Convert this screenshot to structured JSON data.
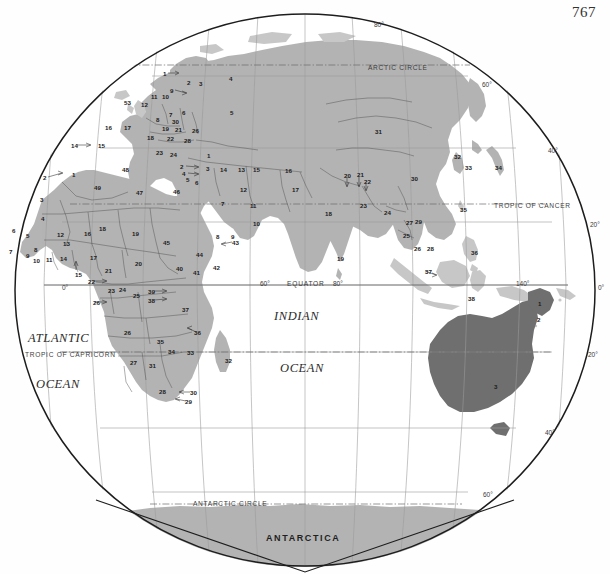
{
  "page": {
    "number": "767",
    "background_color": "#ffffff",
    "land_color": "#b3b3b3",
    "land_dark_color": "#6e6e6e",
    "island_color": "#c9c9c9",
    "border_color": "#555555",
    "graticule_color": "#8d8d8d",
    "outline_color": "#1a1a1a"
  },
  "oceans": [
    {
      "id": "atlantic",
      "line1": "ATLANTIC",
      "line2": "OCEAN",
      "x1": 28,
      "y1": 332,
      "x2": 36,
      "y2": 378
    },
    {
      "id": "indian",
      "line1": "INDIAN",
      "line2": "OCEAN",
      "x1": 274,
      "y1": 310,
      "x2": 280,
      "y2": 362
    }
  ],
  "reference_lines": [
    {
      "name": "arctic-circle",
      "label": "ARCTIC CIRCLE",
      "x": 368,
      "y": 65
    },
    {
      "name": "tropic-of-cancer",
      "label": "TROPIC OF CANCER",
      "x": 494,
      "y": 203
    },
    {
      "name": "equator",
      "label": "EQUATOR",
      "x": 287,
      "y": 281
    },
    {
      "name": "tropic-of-capricorn",
      "label": "TROPIC OF CAPRICORN",
      "x": 25,
      "y": 352
    },
    {
      "name": "antarctic-circle",
      "label": "ANTARCTIC CIRCLE",
      "x": 193,
      "y": 501
    },
    {
      "name": "antarctica",
      "label": "ANTARCTICA",
      "x": 266,
      "y": 534
    }
  ],
  "graticule_labels": [
    {
      "label": "80°",
      "x": 374,
      "y": 22
    },
    {
      "label": "60°",
      "x": 482,
      "y": 82
    },
    {
      "label": "40°",
      "x": 548,
      "y": 148
    },
    {
      "label": "20°",
      "x": 590,
      "y": 222
    },
    {
      "label": "0°",
      "x": 598,
      "y": 285
    },
    {
      "label": "20°",
      "x": 588,
      "y": 352
    },
    {
      "label": "40°",
      "x": 545,
      "y": 430
    },
    {
      "label": "60°",
      "x": 483,
      "y": 492
    },
    {
      "label": "0°",
      "x": 62,
      "y": 285
    },
    {
      "label": "60°",
      "x": 260,
      "y": 281
    },
    {
      "label": "80°",
      "x": 333,
      "y": 281
    },
    {
      "label": "140°",
      "x": 516,
      "y": 281
    }
  ],
  "country_numbers": [
    {
      "n": "1",
      "x": 163,
      "y": 71,
      "leader": "right"
    },
    {
      "n": "2",
      "x": 187,
      "y": 80
    },
    {
      "n": "3",
      "x": 199,
      "y": 81
    },
    {
      "n": "4",
      "x": 229,
      "y": 76
    },
    {
      "n": "9",
      "x": 170,
      "y": 88,
      "leader": "right"
    },
    {
      "n": "10",
      "x": 162,
      "y": 94
    },
    {
      "n": "11",
      "x": 151,
      "y": 94
    },
    {
      "n": "12",
      "x": 141,
      "y": 102
    },
    {
      "n": "53",
      "x": 124,
      "y": 100
    },
    {
      "n": "5",
      "x": 230,
      "y": 110
    },
    {
      "n": "6",
      "x": 182,
      "y": 110
    },
    {
      "n": "7",
      "x": 169,
      "y": 112
    },
    {
      "n": "8",
      "x": 156,
      "y": 117
    },
    {
      "n": "30",
      "x": 172,
      "y": 119
    },
    {
      "n": "16",
      "x": 105,
      "y": 125
    },
    {
      "n": "17",
      "x": 124,
      "y": 125
    },
    {
      "n": "19",
      "x": 162,
      "y": 126
    },
    {
      "n": "21",
      "x": 175,
      "y": 127
    },
    {
      "n": "26",
      "x": 192,
      "y": 128
    },
    {
      "n": "18",
      "x": 147,
      "y": 135
    },
    {
      "n": "22",
      "x": 167,
      "y": 136
    },
    {
      "n": "28",
      "x": 184,
      "y": 138
    },
    {
      "n": "23",
      "x": 156,
      "y": 150
    },
    {
      "n": "24",
      "x": 170,
      "y": 152
    },
    {
      "n": "1",
      "x": 207,
      "y": 153
    },
    {
      "n": "2",
      "x": 180,
      "y": 164,
      "leader": "right"
    },
    {
      "n": "3",
      "x": 206,
      "y": 166
    },
    {
      "n": "4",
      "x": 182,
      "y": 171,
      "leader": "right"
    },
    {
      "n": "5",
      "x": 186,
      "y": 177
    },
    {
      "n": "6",
      "x": 195,
      "y": 180
    },
    {
      "n": "14",
      "x": 220,
      "y": 167
    },
    {
      "n": "13",
      "x": 238,
      "y": 167
    },
    {
      "n": "15",
      "x": 253,
      "y": 167
    },
    {
      "n": "16",
      "x": 285,
      "y": 168
    },
    {
      "n": "12",
      "x": 240,
      "y": 187
    },
    {
      "n": "17",
      "x": 292,
      "y": 187
    },
    {
      "n": "7",
      "x": 221,
      "y": 201
    },
    {
      "n": "11",
      "x": 250,
      "y": 203
    },
    {
      "n": "10",
      "x": 253,
      "y": 221
    },
    {
      "n": "8",
      "x": 216,
      "y": 234
    },
    {
      "n": "9",
      "x": 231,
      "y": 234
    },
    {
      "n": "43",
      "x": 232,
      "y": 240,
      "leader": "left"
    },
    {
      "n": "44",
      "x": 196,
      "y": 252
    },
    {
      "n": "42",
      "x": 213,
      "y": 265
    },
    {
      "n": "14",
      "x": 71,
      "y": 143,
      "leader": "right"
    },
    {
      "n": "15",
      "x": 98,
      "y": 143
    },
    {
      "n": "2",
      "x": 43,
      "y": 175,
      "leader": "right"
    },
    {
      "n": "1",
      "x": 72,
      "y": 172
    },
    {
      "n": "48",
      "x": 122,
      "y": 167
    },
    {
      "n": "49",
      "x": 94,
      "y": 185
    },
    {
      "n": "47",
      "x": 136,
      "y": 190
    },
    {
      "n": "46",
      "x": 173,
      "y": 189
    },
    {
      "n": "3",
      "x": 40,
      "y": 197
    },
    {
      "n": "4",
      "x": 41,
      "y": 216
    },
    {
      "n": "6",
      "x": 12,
      "y": 228
    },
    {
      "n": "5",
      "x": 26,
      "y": 233
    },
    {
      "n": "7",
      "x": 9,
      "y": 249
    },
    {
      "n": "8",
      "x": 34,
      "y": 247
    },
    {
      "n": "9",
      "x": 26,
      "y": 253
    },
    {
      "n": "10",
      "x": 33,
      "y": 258
    },
    {
      "n": "11",
      "x": 46,
      "y": 257
    },
    {
      "n": "12",
      "x": 57,
      "y": 232
    },
    {
      "n": "13",
      "x": 63,
      "y": 241
    },
    {
      "n": "14",
      "x": 60,
      "y": 256
    },
    {
      "n": "15",
      "x": 75,
      "y": 272,
      "leader": "up"
    },
    {
      "n": "16",
      "x": 84,
      "y": 231
    },
    {
      "n": "17",
      "x": 90,
      "y": 255
    },
    {
      "n": "18",
      "x": 99,
      "y": 226
    },
    {
      "n": "19",
      "x": 132,
      "y": 231
    },
    {
      "n": "45",
      "x": 163,
      "y": 240
    },
    {
      "n": "20",
      "x": 135,
      "y": 261
    },
    {
      "n": "21",
      "x": 105,
      "y": 268
    },
    {
      "n": "40",
      "x": 176,
      "y": 266
    },
    {
      "n": "41",
      "x": 193,
      "y": 270
    },
    {
      "n": "22",
      "x": 88,
      "y": 279,
      "leader": "right"
    },
    {
      "n": "23",
      "x": 108,
      "y": 288
    },
    {
      "n": "24",
      "x": 119,
      "y": 287
    },
    {
      "n": "39",
      "x": 148,
      "y": 289,
      "leader": "right"
    },
    {
      "n": "38",
      "x": 148,
      "y": 298,
      "leader": "right"
    },
    {
      "n": "25",
      "x": 133,
      "y": 293
    },
    {
      "n": "26",
      "x": 93,
      "y": 300,
      "leader": "right"
    },
    {
      "n": "37",
      "x": 182,
      "y": 307
    },
    {
      "n": "36",
      "x": 194,
      "y": 330,
      "leader": "left"
    },
    {
      "n": "26",
      "x": 124,
      "y": 330
    },
    {
      "n": "35",
      "x": 157,
      "y": 339
    },
    {
      "n": "33",
      "x": 187,
      "y": 350
    },
    {
      "n": "34",
      "x": 168,
      "y": 349
    },
    {
      "n": "27",
      "x": 130,
      "y": 360
    },
    {
      "n": "31",
      "x": 149,
      "y": 363
    },
    {
      "n": "32",
      "x": 225,
      "y": 358
    },
    {
      "n": "28",
      "x": 159,
      "y": 389
    },
    {
      "n": "30",
      "x": 190,
      "y": 390,
      "leader": "left"
    },
    {
      "n": "29",
      "x": 185,
      "y": 399,
      "leader": "left"
    },
    {
      "n": "31",
      "x": 375,
      "y": 129
    },
    {
      "n": "20",
      "x": 344,
      "y": 173,
      "leader": "down"
    },
    {
      "n": "21",
      "x": 357,
      "y": 172,
      "leader": "down"
    },
    {
      "n": "22",
      "x": 364,
      "y": 179,
      "leader": "down"
    },
    {
      "n": "30",
      "x": 411,
      "y": 176
    },
    {
      "n": "32",
      "x": 454,
      "y": 154
    },
    {
      "n": "33",
      "x": 465,
      "y": 165
    },
    {
      "n": "34",
      "x": 495,
      "y": 165
    },
    {
      "n": "18",
      "x": 325,
      "y": 211
    },
    {
      "n": "23",
      "x": 360,
      "y": 203
    },
    {
      "n": "24",
      "x": 384,
      "y": 210
    },
    {
      "n": "35",
      "x": 460,
      "y": 207
    },
    {
      "n": "27",
      "x": 406,
      "y": 220
    },
    {
      "n": "29",
      "x": 415,
      "y": 219
    },
    {
      "n": "25",
      "x": 403,
      "y": 233
    },
    {
      "n": "26",
      "x": 414,
      "y": 246
    },
    {
      "n": "28",
      "x": 427,
      "y": 246
    },
    {
      "n": "19",
      "x": 337,
      "y": 256
    },
    {
      "n": "36",
      "x": 471,
      "y": 250
    },
    {
      "n": "37",
      "x": 425,
      "y": 269,
      "leader": "left"
    },
    {
      "n": "38",
      "x": 468,
      "y": 296
    },
    {
      "n": "1",
      "x": 538,
      "y": 301
    },
    {
      "n": "2",
      "x": 537,
      "y": 317
    },
    {
      "n": "3",
      "x": 494,
      "y": 384
    }
  ]
}
